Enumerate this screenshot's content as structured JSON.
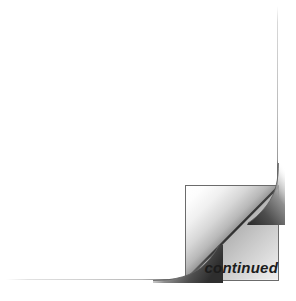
{
  "scene": {
    "width": 296,
    "height": 301,
    "background_color": "#ffffff"
  },
  "paper": {
    "name": "document-sheet",
    "fill_color": "#ffffff",
    "edge_color": "#6b6b6b",
    "left": 6,
    "top": 6,
    "width": 272,
    "height": 274
  },
  "curl": {
    "name": "page-curl",
    "description": "peeled bottom-right corner of the page",
    "left": 185,
    "top": 185,
    "width": 94,
    "height": 96,
    "fold_line_color": "#4a4a4a",
    "outline_color": "#6b6b6b",
    "highlight_color": "#ffffff",
    "shadow_color": "#555555"
  },
  "label": {
    "name": "continued-label",
    "text": "continued",
    "color": "#1c1c1c",
    "style": "bold-italic",
    "font_size_px": 15,
    "align": "right"
  }
}
